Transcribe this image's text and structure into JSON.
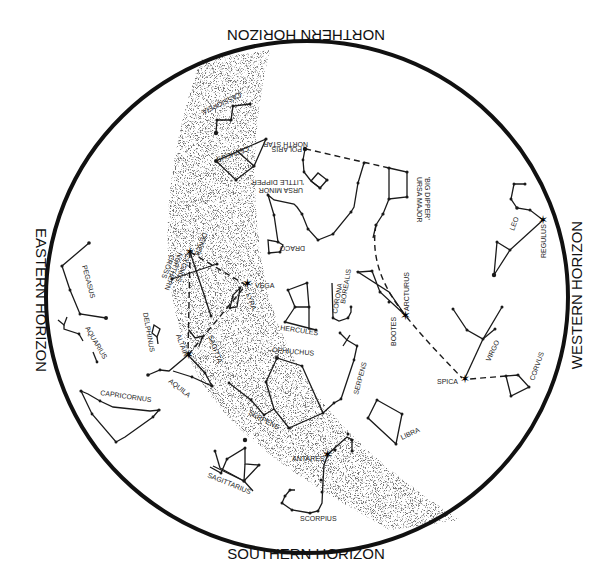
{
  "horizons": {
    "north": "NORTHERN HORIZON",
    "south": "SOUTHERN HORIZON",
    "east": "EASTERN HORIZON",
    "west": "WESTERN HORIZON"
  },
  "constellations": {
    "cassiopeia": "CASSIOPEIA",
    "cepheus": "CEPHEUS",
    "polaris": "POLARIS",
    "north_star": "NORTH STAR",
    "ursa_minor": "URSA MINOR",
    "little_dipper": "'LITTLE DIPPER'",
    "ursa_major": "URSA MAJOR",
    "big_dipper": "'BIG DIPPER'",
    "draco": "DRACO",
    "leo": "LEO",
    "regulus": "REGULUS",
    "deneb": "DENEB",
    "cygnus": "CYGNUS",
    "northern_cross": "NORTHERN",
    "cross": "CROSS",
    "vega": "VEGA",
    "lyra": "LYRA",
    "hercules": "HERCULES",
    "corona_borealis_1": "CORONA",
    "corona_borealis_2": "BOREALIS",
    "bootes": "BOOTES",
    "arcturus": "ARCTURUS",
    "pegasus": "PEGASUS",
    "aquarius": "AQUARIUS",
    "delphinus": "DELPHINUS",
    "altair": "ALTAIR",
    "sagitta": "SAGITTA",
    "aquila": "AQUILA",
    "ophiuchus": "OPHIUCHUS",
    "serpens_1": "SERPENS",
    "serpens_2": "SERPENS",
    "virgo": "VIRGO",
    "spica": "SPICA",
    "corvus": "CORVUS",
    "libra": "LIBRA",
    "capricornus": "CAPRICORNUS",
    "sagittarius": "SAGITTARIUS",
    "antares": "ANTARES",
    "scorpius": "SCORPIUS"
  },
  "colors": {
    "ink": "#1a1a1a",
    "background": "#ffffff"
  }
}
